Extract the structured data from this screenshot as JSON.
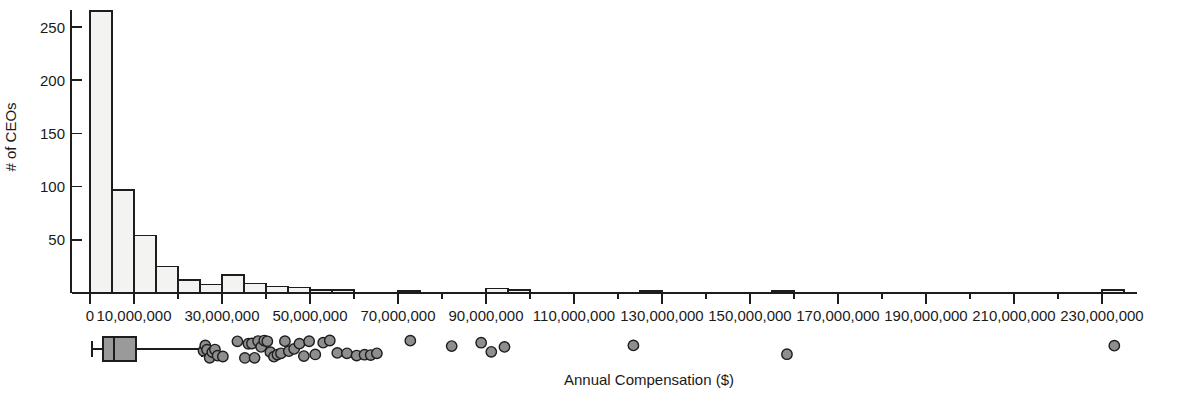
{
  "figure": {
    "title": "",
    "background_color": "#ffffff",
    "ink_color": "#1d1d1d",
    "bar_fill_color": "#f3f3f1",
    "box_fill_color": "#9a9a9a",
    "outlier_fill_color": "#8e8e8e"
  },
  "axes": {
    "y_title": "# of CEOs",
    "x_title": "Annual Compensation ($)",
    "y_ticks": [
      50,
      100,
      150,
      200,
      250
    ],
    "y_tick_labels": [
      "50",
      "100",
      "150",
      "200",
      "250"
    ],
    "x_tick_labels": [
      "0",
      "10,000,000",
      "30,000,000",
      "50,000,000",
      "70,000,000",
      "90,000,000",
      "110,000,000",
      "130,000,000",
      "150,000,000",
      "170,000,000",
      "190,000,000",
      "210,000,000",
      "230,000,000"
    ],
    "x_tick_values": [
      0,
      10000000,
      30000000,
      50000000,
      70000000,
      90000000,
      110000000,
      130000000,
      150000000,
      170000000,
      190000000,
      210000000,
      230000000
    ],
    "x_minor_tick_values": [
      20000000,
      40000000,
      60000000,
      80000000,
      100000000,
      120000000,
      140000000,
      160000000,
      180000000,
      200000000,
      220000000
    ]
  },
  "chart_data": {
    "type": "bar",
    "title": "",
    "subtitle": "",
    "xlabel": "Annual Compensation ($)",
    "ylabel": "# of CEOs",
    "xlim": [
      -4000000,
      240000000
    ],
    "ylim": [
      0,
      270
    ],
    "grid": false,
    "legend": "none",
    "bin_width": 5000000,
    "categories": [
      "0-5M",
      "5M-10M",
      "10M-15M",
      "15M-20M",
      "20M-25M",
      "25M-30M",
      "30M-35M",
      "35M-40M",
      "40M-45M",
      "45M-50M",
      "50M-55M",
      "55M-60M",
      "60M-65M",
      "65M-70M",
      "70M-75M",
      "75M-80M",
      "80M-85M",
      "85M-90M",
      "90M-95M",
      "95M-100M",
      "100M-105M",
      "105M-110M",
      "110M-115M",
      "115M-120M",
      "120M-125M",
      "125M-130M",
      "130M-135M",
      "135M-140M",
      "140M-145M",
      "145M-150M",
      "150M-155M",
      "155M-160M",
      "160M-165M",
      "165M-170M",
      "170M-175M",
      "175M-180M",
      "180M-185M",
      "185M-190M",
      "190M-195M",
      "195M-200M",
      "200M-205M",
      "205M-210M",
      "210M-215M",
      "215M-220M",
      "220M-225M",
      "225M-230M",
      "230M-235M"
    ],
    "bin_starts": [
      0,
      5000000,
      10000000,
      15000000,
      20000000,
      25000000,
      30000000,
      35000000,
      40000000,
      45000000,
      50000000,
      55000000,
      60000000,
      65000000,
      70000000,
      75000000,
      80000000,
      85000000,
      90000000,
      95000000,
      100000000,
      105000000,
      110000000,
      115000000,
      120000000,
      125000000,
      130000000,
      135000000,
      140000000,
      145000000,
      150000000,
      155000000,
      160000000,
      165000000,
      170000000,
      175000000,
      180000000,
      185000000,
      190000000,
      195000000,
      200000000,
      205000000,
      210000000,
      215000000,
      220000000,
      225000000,
      230000000
    ],
    "values": [
      265,
      97,
      54,
      25,
      12,
      8,
      17,
      9,
      6,
      5,
      3,
      3,
      0,
      0,
      2,
      0,
      0,
      0,
      4,
      3,
      0,
      0,
      0,
      0,
      0,
      2,
      0,
      0,
      0,
      0,
      0,
      2,
      0,
      0,
      0,
      0,
      0,
      0,
      0,
      0,
      0,
      0,
      0,
      0,
      0,
      0,
      3
    ]
  },
  "boxplot": {
    "description": "Horizontal box-and-whisker plot with outliers below the histogram",
    "whisker_low": 500000,
    "q1": 3000000,
    "median": 5500000,
    "q3": 10500000,
    "whisker_high": 25500000,
    "outliers": [
      25800000,
      26200000,
      26600000,
      27200000,
      27800000,
      28400000,
      29000000,
      30200000,
      33500000,
      35200000,
      36000000,
      36800000,
      37400000,
      38200000,
      38900000,
      39600000,
      40300000,
      41000000,
      41800000,
      42600000,
      43400000,
      44300000,
      45200000,
      46400000,
      47600000,
      48600000,
      49800000,
      51200000,
      53000000,
      54500000,
      56200000,
      58400000,
      60600000,
      62400000,
      63800000,
      65200000,
      72800000,
      82200000,
      88900000,
      91200000,
      94200000,
      123500000,
      158400000,
      232800000
    ],
    "outlier_count": 44
  }
}
